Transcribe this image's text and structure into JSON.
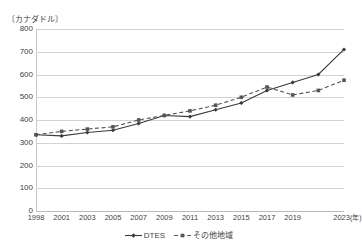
{
  "chart_data": {
    "type": "line",
    "title": "",
    "subtitle": "",
    "unit_label": "〔カナダドル〕",
    "xlabel": "年",
    "ylabel": "",
    "ylim": [
      0,
      800
    ],
    "y_ticks": [
      800,
      700,
      600,
      500,
      400,
      300,
      200,
      100,
      0
    ],
    "grid": true,
    "legend_position": "bottom",
    "categories": [
      "1998",
      "2001",
      "2003",
      "2005",
      "2007",
      "2009",
      "2011",
      "2013",
      "2015",
      "2017",
      "2019",
      "2021",
      "2023"
    ],
    "x_tick_labels": [
      "1998",
      "2001",
      "2003",
      "2005",
      "2007",
      "2009",
      "2011",
      "2013",
      "2015",
      "2017",
      "2019",
      "",
      "2023"
    ],
    "x_axis_unit_suffix": "(年)",
    "series": [
      {
        "name": "DTES",
        "style": "solid",
        "marker": "diamond",
        "color": "#3a3a3a",
        "values": [
          335,
          330,
          345,
          355,
          385,
          420,
          415,
          445,
          475,
          530,
          565,
          600,
          710
        ]
      },
      {
        "name": "その他地域",
        "style": "dashed",
        "marker": "square",
        "color": "#555555",
        "values": [
          335,
          350,
          360,
          370,
          400,
          420,
          440,
          465,
          500,
          545,
          510,
          530,
          575
        ]
      }
    ],
    "legend": [
      {
        "label": "DTES",
        "style": "solid",
        "marker": "diamond",
        "color": "#3a3a3a"
      },
      {
        "label": "その他地域",
        "style": "dashed",
        "marker": "square",
        "color": "#555555"
      }
    ]
  },
  "colors": {
    "gridline": "#d2d2d2",
    "axis": "#b9b9b9",
    "text": "#3f3f3f",
    "background": "#ffffff"
  }
}
